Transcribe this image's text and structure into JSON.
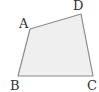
{
  "diagram": {
    "type": "quadrilateral",
    "fill_color": "#efefef",
    "stroke_color": "#8c8c8c",
    "vertices": [
      {
        "name": "A",
        "x": 30,
        "y": 29,
        "label_x": 19,
        "label_y": 28
      },
      {
        "name": "D",
        "x": 81,
        "y": 14,
        "label_x": 73,
        "label_y": 10
      },
      {
        "name": "C",
        "x": 93,
        "y": 76,
        "label_x": 87,
        "label_y": 90
      },
      {
        "name": "B",
        "x": 18,
        "y": 76,
        "label_x": 10,
        "label_y": 90
      }
    ],
    "labels": {
      "A": "A",
      "B": "B",
      "C": "C",
      "D": "D"
    }
  }
}
